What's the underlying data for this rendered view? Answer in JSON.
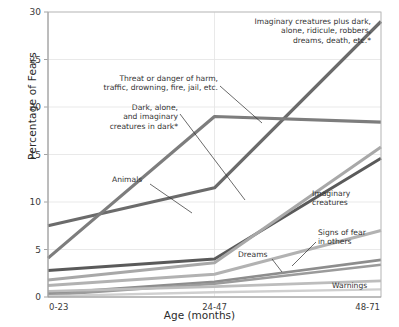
{
  "chart_data": {
    "type": "line",
    "title": "",
    "xlabel": "Age  (months)",
    "ylabel": "Percentage of Fears",
    "categories": [
      "0-23",
      "24-47",
      "48-71"
    ],
    "x": [
      0,
      1,
      2
    ],
    "ylim": [
      0,
      30
    ],
    "yticks": [
      0,
      5,
      10,
      15,
      20,
      25,
      30
    ],
    "ytick_labels": [
      "0",
      "5",
      "10",
      "15",
      "20",
      "25",
      "30"
    ],
    "grid": "horizontal",
    "legend": "none (direct line labels with leader lines)",
    "footnote_marker": "*",
    "series": [
      {
        "name": "Imaginary creatures plus dark, alone, ridicule, robbers, dreams, death, etc.*",
        "label": "Imaginary creatures plus dark,\nalone, ridicule, robbers,\ndreams, death, etc.*",
        "values": [
          7.5,
          11.5,
          29.0
        ],
        "color": "#6b6b6b",
        "width": 3.2
      },
      {
        "name": "Threat or danger of harm, traffic, drowning, fire, jail, etc.",
        "label": "Threat or danger of harm,\ntraffic, drowning, fire, jail, etc.",
        "values": [
          4.1,
          19.0,
          18.4
        ],
        "color": "#7d7d7d",
        "width": 3.2
      },
      {
        "name": "Animals",
        "label": "Animals",
        "values": [
          2.8,
          4.0,
          14.6
        ],
        "color": "#5a5a5a",
        "width": 3.0
      },
      {
        "name": "Dark, alone, and imaginary creatures in dark*",
        "label": "Dark, alone,\nand imaginary\ncreatures in dark*",
        "values": [
          1.8,
          3.6,
          15.8
        ],
        "color": "#a8a8a8",
        "width": 3.0
      },
      {
        "name": "Imaginary creatures",
        "label": "Imaginary\ncreatures",
        "values": [
          1.2,
          2.4,
          7.0
        ],
        "color": "#b2b2b2",
        "width": 3.0
      },
      {
        "name": "Signs of fear in others",
        "label": "Signs of fear\nin others",
        "values": [
          0.4,
          1.6,
          3.9
        ],
        "color": "#8d8d8d",
        "width": 2.6
      },
      {
        "name": "Dreams",
        "label": "Dreams",
        "values": [
          0.2,
          1.4,
          3.4
        ],
        "color": "#9b9b9b",
        "width": 2.6
      },
      {
        "name": "Warnings",
        "label": "Warnings",
        "values": [
          0.6,
          1.1,
          1.7
        ],
        "color": "#bdbdbd",
        "width": 2.6
      },
      {
        "name": "Lower unlabeled band",
        "label": "",
        "values": [
          0.1,
          0.5,
          0.8
        ],
        "color": "#cfcfcf",
        "width": 2.4
      }
    ],
    "annotations": [
      {
        "id": "anno-imaginary-plus",
        "lines": [
          "Imaginary creatures plus dark,",
          "alone, ridicule, robbers,",
          "dreams, death, etc.*"
        ],
        "anchor": "right",
        "text_x": 371,
        "text_y": 24,
        "leader": null
      },
      {
        "id": "anno-threat",
        "lines": [
          "Threat or danger of harm,",
          "traffic, drowning, fire, jail, etc."
        ],
        "anchor": "right",
        "text_x": 218,
        "text_y": 81,
        "leader": "M 220,86 L 262,123"
      },
      {
        "id": "anno-dark-alone",
        "lines": [
          "Dark, alone,",
          "and imaginary",
          "creatures in dark*"
        ],
        "anchor": "right",
        "text_x": 178,
        "text_y": 110,
        "leader": "M 180,114 L 245,200"
      },
      {
        "id": "anno-animals",
        "lines": [
          "Animals"
        ],
        "anchor": "start",
        "text_x": 112,
        "text_y": 182,
        "leader": "M 150,184 L 192,213"
      },
      {
        "id": "anno-imaginary-creatures",
        "lines": [
          "Imaginary",
          "creatures"
        ],
        "anchor": "start",
        "text_x": 312,
        "text_y": 196,
        "leader": null
      },
      {
        "id": "anno-signs-of-fear",
        "lines": [
          "Signs of fear",
          "in others"
        ],
        "anchor": "start",
        "text_x": 318,
        "text_y": 235,
        "leader": "M 316,242 L 292,266"
      },
      {
        "id": "anno-dreams",
        "lines": [
          "Dreams"
        ],
        "anchor": "start",
        "text_x": 238,
        "text_y": 257,
        "leader": "M 272,259 L 282,272"
      },
      {
        "id": "anno-warnings",
        "lines": [
          "Warnings"
        ],
        "anchor": "start",
        "text_x": 332,
        "text_y": 288,
        "leader": null
      }
    ]
  }
}
